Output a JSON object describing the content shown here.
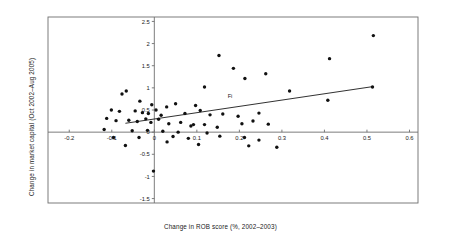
{
  "chart_data": {
    "type": "scatter",
    "title": "",
    "xlabel": "Change in ROB score (%, 2002–2003)",
    "ylabel": "Change in market capital (Oct 2002–Aug 2005)",
    "xlim": [
      -0.25,
      0.62
    ],
    "ylim": [
      -1.6,
      2.6
    ],
    "xticks": [
      -0.2,
      -0.1,
      0,
      0.1,
      0.2,
      0.3,
      0.4,
      0.5,
      0.6
    ],
    "xticklabels": [
      "-0.2",
      "-0.1",
      "0",
      "0.1",
      "0.2",
      "0.3",
      "0.4",
      "0.5",
      "0.6"
    ],
    "yticks": [
      -1.5,
      -1,
      -0.5,
      0,
      0.5,
      1,
      1.5,
      2,
      2.5
    ],
    "yticklabels": [
      "-1.5",
      "-1",
      "-0.5",
      "0",
      "0.5",
      "1",
      "1.5",
      "2",
      "2.5"
    ],
    "grid": false,
    "legend": null,
    "legend_position": "none",
    "annotations": [
      {
        "text": "Fi",
        "x": 0.178,
        "y": 0.78
      }
    ],
    "trendline": {
      "label": "linear fit",
      "x": [
        -0.068,
        0.515
      ],
      "y": [
        0.2,
        1.03
      ]
    },
    "points": [
      {
        "x": 0.515,
        "y": 2.18
      },
      {
        "x": 0.152,
        "y": 1.73
      },
      {
        "x": 0.412,
        "y": 1.66
      },
      {
        "x": 0.186,
        "y": 1.44
      },
      {
        "x": 0.213,
        "y": 1.21
      },
      {
        "x": 0.262,
        "y": 1.32
      },
      {
        "x": 0.118,
        "y": 1.02
      },
      {
        "x": -0.076,
        "y": 0.86
      },
      {
        "x": -0.066,
        "y": 0.93
      },
      {
        "x": 0.318,
        "y": 0.93
      },
      {
        "x": -0.034,
        "y": 0.7
      },
      {
        "x": -0.006,
        "y": 0.62
      },
      {
        "x": 0.029,
        "y": 0.57
      },
      {
        "x": 0.05,
        "y": 0.64
      },
      {
        "x": 0.097,
        "y": 0.6
      },
      {
        "x": 0.408,
        "y": 0.72
      },
      {
        "x": 0.513,
        "y": 1.02
      },
      {
        "x": -0.101,
        "y": 0.5
      },
      {
        "x": -0.082,
        "y": 0.47
      },
      {
        "x": -0.045,
        "y": 0.48
      },
      {
        "x": -0.028,
        "y": 0.44
      },
      {
        "x": -0.014,
        "y": 0.42
      },
      {
        "x": 0.004,
        "y": 0.5
      },
      {
        "x": 0.016,
        "y": 0.38
      },
      {
        "x": 0.072,
        "y": 0.42
      },
      {
        "x": 0.108,
        "y": 0.49
      },
      {
        "x": 0.131,
        "y": 0.39
      },
      {
        "x": 0.161,
        "y": 0.41
      },
      {
        "x": 0.197,
        "y": 0.36
      },
      {
        "x": 0.246,
        "y": 0.43
      },
      {
        "x": -0.112,
        "y": 0.31
      },
      {
        "x": -0.09,
        "y": 0.26
      },
      {
        "x": -0.06,
        "y": 0.27
      },
      {
        "x": -0.04,
        "y": 0.24
      },
      {
        "x": -0.02,
        "y": 0.3
      },
      {
        "x": -0.008,
        "y": 0.22
      },
      {
        "x": 0.01,
        "y": 0.29
      },
      {
        "x": 0.034,
        "y": 0.19
      },
      {
        "x": 0.062,
        "y": 0.22
      },
      {
        "x": 0.086,
        "y": 0.14
      },
      {
        "x": 0.092,
        "y": 0.17
      },
      {
        "x": 0.118,
        "y": 0.17
      },
      {
        "x": 0.148,
        "y": 0.11
      },
      {
        "x": 0.206,
        "y": 0.19
      },
      {
        "x": 0.232,
        "y": 0.25
      },
      {
        "x": 0.268,
        "y": 0.18
      },
      {
        "x": -0.118,
        "y": 0.06
      },
      {
        "x": -0.052,
        "y": 0.03
      },
      {
        "x": -0.016,
        "y": 0.04
      },
      {
        "x": 0.02,
        "y": 0.02
      },
      {
        "x": 0.056,
        "y": 0.0
      },
      {
        "x": 0.124,
        "y": -0.02
      },
      {
        "x": -0.096,
        "y": -0.12
      },
      {
        "x": -0.036,
        "y": -0.12
      },
      {
        "x": 0.044,
        "y": -0.1
      },
      {
        "x": 0.08,
        "y": -0.14
      },
      {
        "x": 0.154,
        "y": -0.09
      },
      {
        "x": 0.212,
        "y": -0.12
      },
      {
        "x": 0.246,
        "y": -0.18
      },
      {
        "x": -0.068,
        "y": -0.3
      },
      {
        "x": 0.03,
        "y": -0.22
      },
      {
        "x": 0.104,
        "y": -0.28
      },
      {
        "x": 0.222,
        "y": -0.31
      },
      {
        "x": 0.288,
        "y": -0.34
      },
      {
        "x": -0.002,
        "y": -0.88
      }
    ]
  }
}
